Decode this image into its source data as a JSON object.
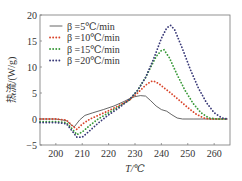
{
  "chart_data": {
    "type": "line",
    "title": "",
    "xlabel": "T/℃",
    "ylabel": "热流/(W/g)",
    "xlim": [
      194,
      266
    ],
    "ylim": [
      -5,
      20
    ],
    "xticks": [
      200,
      210,
      220,
      230,
      240,
      250,
      260
    ],
    "yticks": [
      -5,
      0,
      5,
      10,
      15,
      20
    ],
    "grid": false,
    "legend_position": "upper left",
    "series": [
      {
        "name": "β=5℃/min",
        "style": "solid",
        "color": "#555555",
        "x": [
          194,
          200,
          204,
          206,
          207,
          209,
          211,
          214,
          218,
          222,
          226,
          229,
          232,
          234,
          236,
          238,
          240,
          242,
          244,
          246,
          248,
          252,
          256,
          260,
          265
        ],
        "y": [
          0,
          0,
          -0.3,
          -1.2,
          -1.5,
          -0.2,
          0.7,
          1.2,
          1.8,
          2.5,
          3.4,
          4.2,
          4.5,
          4.4,
          3.5,
          2.5,
          1.8,
          1.5,
          0.8,
          0.2,
          0,
          0,
          0,
          0,
          0
        ]
      },
      {
        "name": "β=10℃/min",
        "style": "dotted",
        "color": "#d9442a",
        "x": [
          194,
          200,
          204,
          206,
          208,
          210,
          213,
          216,
          220,
          224,
          228,
          231,
          234,
          236,
          237,
          239,
          241,
          244,
          247,
          250,
          253,
          256,
          258,
          262,
          265
        ],
        "y": [
          0,
          0,
          -0.2,
          -1.2,
          -2.0,
          -1.0,
          0,
          0.7,
          1.6,
          2.6,
          3.7,
          5.0,
          6.5,
          7.2,
          7.3,
          6.8,
          6.0,
          4.8,
          3.5,
          2.2,
          1.0,
          0.2,
          0,
          0,
          0
        ]
      },
      {
        "name": "β=15℃/min",
        "style": "dotted",
        "color": "#3a9a3a",
        "x": [
          194,
          200,
          204,
          206,
          208,
          210,
          213,
          216,
          220,
          224,
          228,
          231,
          234,
          236,
          238,
          240,
          241,
          243,
          246,
          249,
          252,
          255,
          258,
          261,
          265
        ],
        "y": [
          -0.5,
          -0.5,
          -0.7,
          -1.8,
          -3.0,
          -2.5,
          -1.2,
          0,
          1.2,
          2.4,
          3.7,
          5.5,
          8.0,
          10.0,
          12.0,
          13.2,
          13.3,
          11.8,
          8.5,
          5.5,
          3.0,
          1.2,
          0.2,
          0,
          0
        ]
      },
      {
        "name": "β=20℃/min",
        "style": "dotted",
        "color": "#3a3a78",
        "x": [
          194,
          200,
          204,
          206,
          208,
          210,
          213,
          216,
          220,
          224,
          228,
          231,
          234,
          237,
          240,
          242,
          243.5,
          245,
          248,
          251,
          254,
          257,
          260,
          263,
          265
        ],
        "y": [
          -0.7,
          -0.7,
          -0.9,
          -2.2,
          -3.5,
          -3.5,
          -2.2,
          -0.8,
          0.8,
          2.2,
          3.8,
          5.5,
          8.0,
          11.5,
          15.5,
          17.5,
          18.0,
          17.2,
          13.5,
          9.5,
          6.0,
          3.2,
          1.2,
          0.2,
          0
        ]
      }
    ]
  },
  "axis": {
    "x_label": "T/℃",
    "y_label": "热流/(W/g)",
    "x_tick_labels": [
      "200",
      "210",
      "220",
      "230",
      "240",
      "250",
      "260"
    ],
    "y_tick_labels": [
      "20",
      "15",
      "10",
      "5",
      "0",
      "−5"
    ]
  },
  "legend": [
    {
      "label": "β =5℃/min"
    },
    {
      "label": "β =10℃/min"
    },
    {
      "label": "β =15℃/min"
    },
    {
      "label": "β =20℃/min"
    }
  ]
}
